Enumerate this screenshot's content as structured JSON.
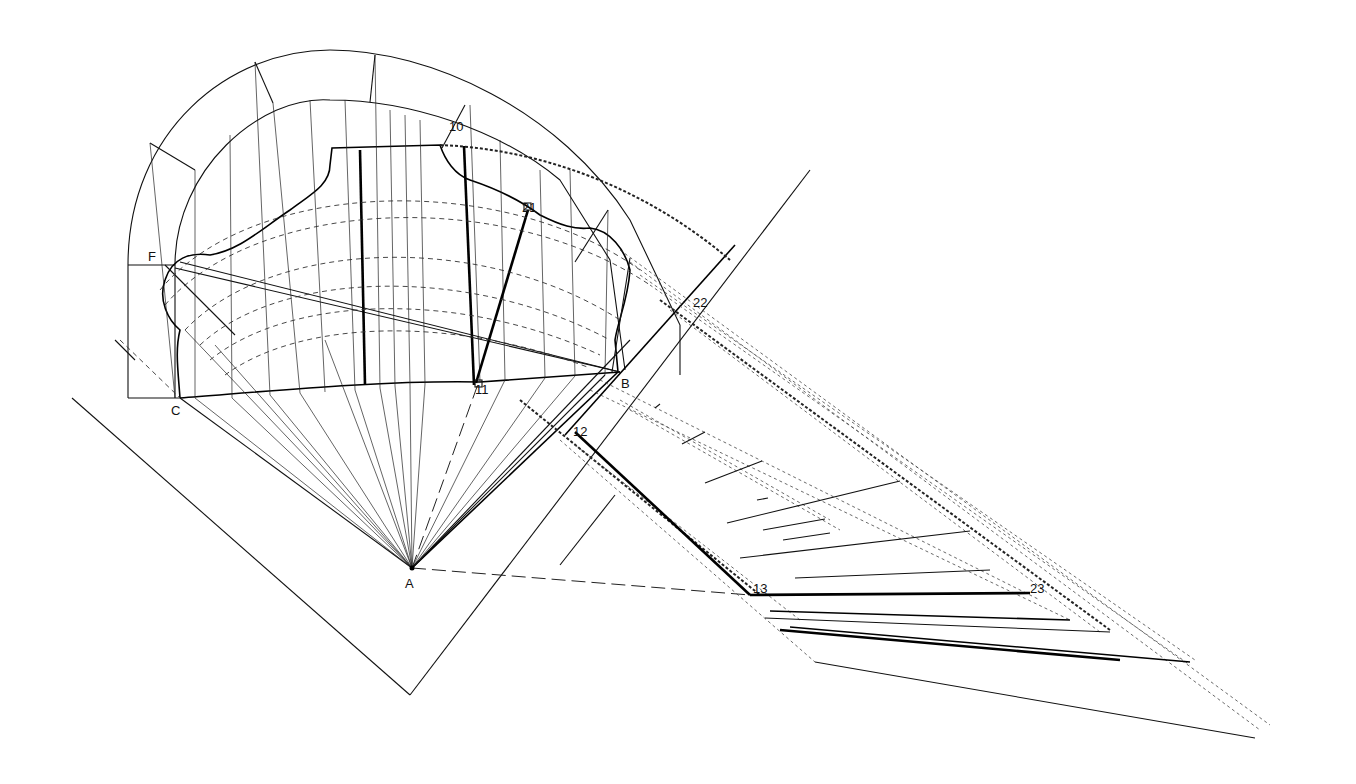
{
  "diagram": {
    "type": "geometric-construction",
    "stroke_color": "#111111",
    "background": "#ffffff"
  },
  "labels": {
    "p10": "10",
    "p21": "21",
    "pF": "F",
    "p22": "22",
    "pB": "B",
    "p11": "11",
    "pC": "C",
    "p12": "12",
    "pA": "A",
    "p13": "13",
    "p23": "23"
  },
  "label_positions": [
    {
      "key": "p10",
      "x": 449,
      "y": 131
    },
    {
      "key": "p21",
      "x": 522,
      "y": 212
    },
    {
      "key": "pF",
      "x": 148,
      "y": 261
    },
    {
      "key": "p22",
      "x": 693,
      "y": 307
    },
    {
      "key": "pB",
      "x": 621,
      "y": 388
    },
    {
      "key": "p11",
      "x": 475,
      "y": 394
    },
    {
      "key": "pC",
      "x": 171,
      "y": 415
    },
    {
      "key": "p12",
      "x": 573,
      "y": 436
    },
    {
      "key": "pA",
      "x": 405,
      "y": 612
    },
    {
      "key": "p13",
      "x": 753,
      "y": 595
    },
    {
      "key": "p23",
      "x": 1030,
      "y": 595
    }
  ]
}
